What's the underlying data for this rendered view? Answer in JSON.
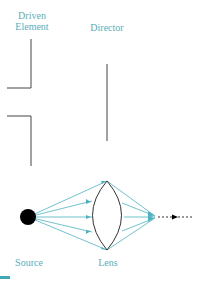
{
  "colors": {
    "label": "#5aaeb9",
    "ray": "#4db3c0",
    "element": "#444444",
    "source": "#000000",
    "accent_bar": "#3fa9b5"
  },
  "labels": {
    "driven_line1": "Driven",
    "driven_line2": "Element",
    "director": "Director",
    "source": "Source",
    "lens": "Lens"
  }
}
